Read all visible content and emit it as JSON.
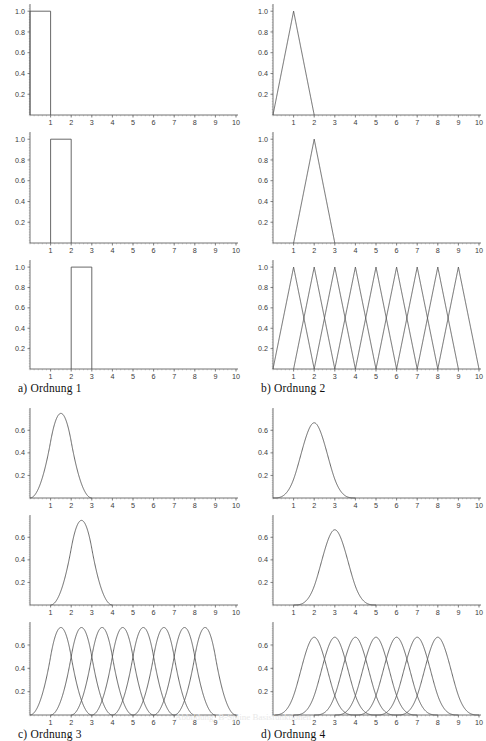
{
  "figure": {
    "title": "B-Spline Basisfunktionen",
    "bottom_caption": "Abbildung: B-Spline Basisfunktionen"
  },
  "panels": [
    {
      "id": "a",
      "caption": "a) Ordnung 1",
      "order": 1,
      "position": "top-left",
      "yticks": [
        "0.2",
        "0.4",
        "0.6",
        "0.8",
        "1.0"
      ],
      "ytickvals": [
        0.2,
        0.4,
        0.6,
        0.8,
        1.0
      ],
      "xticks": [
        "1",
        "2",
        "3",
        "4",
        "5",
        "6",
        "7",
        "8",
        "9",
        "10"
      ],
      "xtickvals": [
        1,
        2,
        3,
        4,
        5,
        6,
        7,
        8,
        9,
        10
      ],
      "ymax": 1.05,
      "subplots": [
        {
          "name": "first-basis",
          "shift_start": 0,
          "count": 1
        },
        {
          "name": "second-basis",
          "shift_start": 1,
          "count": 1
        },
        {
          "name": "third-basis",
          "shift_start": 2,
          "count": 1
        }
      ]
    },
    {
      "id": "b",
      "caption": "b) Ordnung 2",
      "order": 2,
      "position": "top-right",
      "yticks": [
        "0.2",
        "0.4",
        "0.6",
        "0.8",
        "1.0"
      ],
      "ytickvals": [
        0.2,
        0.4,
        0.6,
        0.8,
        1.0
      ],
      "xticks": [
        "1",
        "2",
        "3",
        "4",
        "5",
        "6",
        "7",
        "8",
        "9",
        "10"
      ],
      "xtickvals": [
        1,
        2,
        3,
        4,
        5,
        6,
        7,
        8,
        9,
        10
      ],
      "ymax": 1.05,
      "subplots": [
        {
          "name": "first-basis",
          "shift_start": 0,
          "count": 1
        },
        {
          "name": "second-basis",
          "shift_start": 1,
          "count": 1
        },
        {
          "name": "all-bases",
          "shift_start": 0,
          "count": 9
        }
      ]
    },
    {
      "id": "c",
      "caption": "c) Ordnung 3",
      "order": 3,
      "position": "bottom-left",
      "yticks": [
        "0.2",
        "0.4",
        "0.6"
      ],
      "ytickvals": [
        0.2,
        0.4,
        0.6
      ],
      "xticks": [
        "1",
        "2",
        "3",
        "4",
        "5",
        "6",
        "7",
        "8",
        "9",
        "10"
      ],
      "xtickvals": [
        1,
        2,
        3,
        4,
        5,
        6,
        7,
        8,
        9,
        10
      ],
      "ymax": 0.78,
      "subplots": [
        {
          "name": "first-basis",
          "shift_start": 0,
          "count": 1
        },
        {
          "name": "second-basis",
          "shift_start": 1,
          "count": 1
        },
        {
          "name": "all-bases",
          "shift_start": 0,
          "count": 8
        }
      ]
    },
    {
      "id": "d",
      "caption": "d) Ordnung 4",
      "order": 4,
      "position": "bottom-right",
      "yticks": [
        "0.2",
        "0.4",
        "0.6"
      ],
      "ytickvals": [
        0.2,
        0.4,
        0.6
      ],
      "xticks": [
        "1",
        "2",
        "3",
        "4",
        "5",
        "6",
        "7",
        "8",
        "9",
        "10"
      ],
      "xtickvals": [
        1,
        2,
        3,
        4,
        5,
        6,
        7,
        8,
        9,
        10
      ],
      "ymax": 0.78,
      "subplots": [
        {
          "name": "first-basis",
          "shift_start": 0,
          "count": 1
        },
        {
          "name": "second-basis",
          "shift_start": 1,
          "count": 1
        },
        {
          "name": "all-bases",
          "shift_start": 0,
          "count": 7
        }
      ]
    }
  ],
  "chart_data": {
    "type": "line",
    "xlabel": "",
    "ylabel": "",
    "xlim": [
      0,
      10.4
    ],
    "grid": false,
    "legend": "none",
    "charts": [
      {
        "panel": "a) Ordnung 1",
        "order": 1,
        "ylim": [
          0,
          1.05
        ],
        "yticks": [
          0.2,
          0.4,
          0.6,
          0.8,
          1.0
        ],
        "xticks": [
          1,
          2,
          3,
          4,
          5,
          6,
          7,
          8,
          9,
          10
        ],
        "subplots": [
          {
            "label": "N(1,0)",
            "description": "Rechteckimpuls auf [0,1], Hoehe 1.0",
            "series": [
              {
                "name": "N_0_1",
                "support": [
                  0,
                  1
                ],
                "peak_x": 0.5,
                "peak_y": 1.0
              }
            ]
          },
          {
            "label": "N(1,1)",
            "description": "Rechteckimpuls auf [1,2], Hoehe 1.0",
            "series": [
              {
                "name": "N_1_1",
                "support": [
                  1,
                  2
                ],
                "peak_x": 1.5,
                "peak_y": 1.0
              }
            ]
          },
          {
            "label": "N(1,2)",
            "description": "Rechteckimpuls auf [2,3], Hoehe 1.0",
            "series": [
              {
                "name": "N_2_1",
                "support": [
                  2,
                  3
                ],
                "peak_x": 2.5,
                "peak_y": 1.0
              }
            ]
          }
        ]
      },
      {
        "panel": "b) Ordnung 2",
        "order": 2,
        "ylim": [
          0,
          1.05
        ],
        "yticks": [
          0.2,
          0.4,
          0.6,
          0.8,
          1.0
        ],
        "xticks": [
          1,
          2,
          3,
          4,
          5,
          6,
          7,
          8,
          9,
          10
        ],
        "subplots": [
          {
            "label": "N(2,0)",
            "description": "Dreieck auf [0,2], Spitze bei x=1, Hoehe 1.0",
            "series": [
              {
                "name": "N_0_2",
                "support": [
                  0,
                  2
                ],
                "peak_x": 1,
                "peak_y": 1.0
              }
            ]
          },
          {
            "label": "N(2,1)",
            "description": "Dreieck auf [1,3], Spitze bei x=2, Hoehe 1.0",
            "series": [
              {
                "name": "N_1_2",
                "support": [
                  1,
                  3
                ],
                "peak_x": 2,
                "peak_y": 1.0
              }
            ]
          },
          {
            "label": "alle N(2,i)",
            "description": "9 ueberlappende Dreiecke, Spitzen bei x=1..9, Hoehe 1.0",
            "series": [
              {
                "name": "N_0_2",
                "support": [
                  0,
                  2
                ],
                "peak_x": 1,
                "peak_y": 1.0
              },
              {
                "name": "N_1_2",
                "support": [
                  1,
                  3
                ],
                "peak_x": 2,
                "peak_y": 1.0
              },
              {
                "name": "N_2_2",
                "support": [
                  2,
                  4
                ],
                "peak_x": 3,
                "peak_y": 1.0
              },
              {
                "name": "N_3_2",
                "support": [
                  3,
                  5
                ],
                "peak_x": 4,
                "peak_y": 1.0
              },
              {
                "name": "N_4_2",
                "support": [
                  4,
                  6
                ],
                "peak_x": 5,
                "peak_y": 1.0
              },
              {
                "name": "N_5_2",
                "support": [
                  5,
                  7
                ],
                "peak_x": 6,
                "peak_y": 1.0
              },
              {
                "name": "N_6_2",
                "support": [
                  6,
                  8
                ],
                "peak_x": 7,
                "peak_y": 1.0
              },
              {
                "name": "N_7_2",
                "support": [
                  7,
                  9
                ],
                "peak_x": 8,
                "peak_y": 1.0
              },
              {
                "name": "N_8_2",
                "support": [
                  8,
                  10
                ],
                "peak_x": 9,
                "peak_y": 1.0
              }
            ]
          }
        ]
      },
      {
        "panel": "c) Ordnung 3",
        "order": 3,
        "ylim": [
          0,
          0.78
        ],
        "yticks": [
          0.2,
          0.4,
          0.6
        ],
        "xticks": [
          1,
          2,
          3,
          4,
          5,
          6,
          7,
          8,
          9,
          10
        ],
        "subplots": [
          {
            "label": "N(3,0)",
            "description": "Quadratischer B-Spline auf [0,3], Maximum 0.75 bei x=1.5",
            "series": [
              {
                "name": "N_0_3",
                "support": [
                  0,
                  3
                ],
                "peak_x": 1.5,
                "peak_y": 0.75
              }
            ]
          },
          {
            "label": "N(3,1)",
            "description": "Quadratischer B-Spline auf [1,4], Maximum 0.75 bei x=2.5",
            "series": [
              {
                "name": "N_1_3",
                "support": [
                  1,
                  4
                ],
                "peak_x": 2.5,
                "peak_y": 0.75
              }
            ]
          },
          {
            "label": "alle N(3,i)",
            "description": "8 ueberlappende quadratische B-Splines, Maxima bei x=1.5..8.5",
            "series": [
              {
                "name": "N_0_3",
                "support": [
                  0,
                  3
                ],
                "peak_x": 1.5,
                "peak_y": 0.75
              },
              {
                "name": "N_1_3",
                "support": [
                  1,
                  4
                ],
                "peak_x": 2.5,
                "peak_y": 0.75
              },
              {
                "name": "N_2_3",
                "support": [
                  2,
                  5
                ],
                "peak_x": 3.5,
                "peak_y": 0.75
              },
              {
                "name": "N_3_3",
                "support": [
                  3,
                  6
                ],
                "peak_x": 4.5,
                "peak_y": 0.75
              },
              {
                "name": "N_4_3",
                "support": [
                  4,
                  7
                ],
                "peak_x": 5.5,
                "peak_y": 0.75
              },
              {
                "name": "N_5_3",
                "support": [
                  5,
                  8
                ],
                "peak_x": 6.5,
                "peak_y": 0.75
              },
              {
                "name": "N_6_3",
                "support": [
                  6,
                  9
                ],
                "peak_x": 7.5,
                "peak_y": 0.75
              },
              {
                "name": "N_7_3",
                "support": [
                  7,
                  10
                ],
                "peak_x": 8.5,
                "peak_y": 0.75
              }
            ]
          }
        ]
      },
      {
        "panel": "d) Ordnung 4",
        "order": 4,
        "ylim": [
          0,
          0.78
        ],
        "yticks": [
          0.2,
          0.4,
          0.6
        ],
        "xticks": [
          1,
          2,
          3,
          4,
          5,
          6,
          7,
          8,
          9,
          10
        ],
        "subplots": [
          {
            "label": "N(4,0)",
            "description": "Kubischer B-Spline auf [0,4], Maximum 0.667 bei x=2",
            "series": [
              {
                "name": "N_0_4",
                "support": [
                  0,
                  4
                ],
                "peak_x": 2,
                "peak_y": 0.667
              }
            ]
          },
          {
            "label": "N(4,1)",
            "description": "Kubischer B-Spline auf [1,5], Maximum 0.667 bei x=3",
            "series": [
              {
                "name": "N_1_4",
                "support": [
                  1,
                  5
                ],
                "peak_x": 3,
                "peak_y": 0.667
              }
            ]
          },
          {
            "label": "alle N(4,i)",
            "description": "7 ueberlappende kubische B-Splines, Maxima bei x=2..8",
            "series": [
              {
                "name": "N_0_4",
                "support": [
                  0,
                  4
                ],
                "peak_x": 2,
                "peak_y": 0.667
              },
              {
                "name": "N_1_4",
                "support": [
                  1,
                  5
                ],
                "peak_x": 3,
                "peak_y": 0.667
              },
              {
                "name": "N_2_4",
                "support": [
                  2,
                  6
                ],
                "peak_x": 4,
                "peak_y": 0.667
              },
              {
                "name": "N_3_4",
                "support": [
                  3,
                  7
                ],
                "peak_x": 5,
                "peak_y": 0.667
              },
              {
                "name": "N_4_4",
                "support": [
                  4,
                  8
                ],
                "peak_x": 6,
                "peak_y": 0.667
              },
              {
                "name": "N_5_4",
                "support": [
                  5,
                  9
                ],
                "peak_x": 7,
                "peak_y": 0.667
              },
              {
                "name": "N_6_4",
                "support": [
                  6,
                  10
                ],
                "peak_x": 8,
                "peak_y": 0.667
              }
            ]
          }
        ]
      }
    ]
  }
}
